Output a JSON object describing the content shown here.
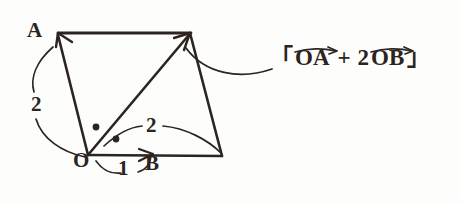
{
  "figure": {
    "kind": "vector-addition-parallelogram-diagram",
    "stroke_color": "#2b2420",
    "background_color": "#fdfdfb",
    "points": {
      "O": {
        "label": "O",
        "x": 88,
        "y": 155
      },
      "A": {
        "label": "A",
        "x": 57,
        "y": 33
      },
      "B": {
        "label": "B",
        "x": 152,
        "y": 155
      },
      "twoB": {
        "x": 222,
        "y": 155
      },
      "sum": {
        "x": 190,
        "y": 33
      }
    },
    "point_labels": {
      "O": "O",
      "A": "A",
      "B": "B"
    },
    "scalar_labels": {
      "oa_scalar": "2",
      "ob_unit": "1",
      "ob_scalar": "2"
    },
    "angle_marks": 2
  },
  "formula": {
    "bracket_open": "「",
    "bracket_close": "」",
    "term1": "OA",
    "operator": "+",
    "coefficient": "2",
    "term2": "OB",
    "full_text": "「OA + 2OB」"
  }
}
